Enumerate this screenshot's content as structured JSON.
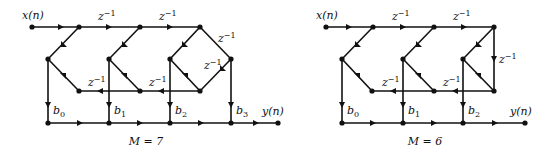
{
  "diagrams": [
    {
      "id": "m7",
      "input_label": "x(n)",
      "output_label": "y(n)",
      "delay_label": "z",
      "delay_exp": "−1",
      "caption": "M = 7",
      "coefficients": [
        {
          "base": "b",
          "sub": "0"
        },
        {
          "base": "b",
          "sub": "1"
        },
        {
          "base": "b",
          "sub": "2"
        },
        {
          "base": "b",
          "sub": "3"
        }
      ]
    },
    {
      "id": "m6",
      "input_label": "x(n)",
      "output_label": "y(n)",
      "delay_label": "z",
      "delay_exp": "−1",
      "caption": "M = 6",
      "coefficients": [
        {
          "base": "b",
          "sub": "0"
        },
        {
          "base": "b",
          "sub": "1"
        },
        {
          "base": "b",
          "sub": "2"
        }
      ]
    }
  ]
}
